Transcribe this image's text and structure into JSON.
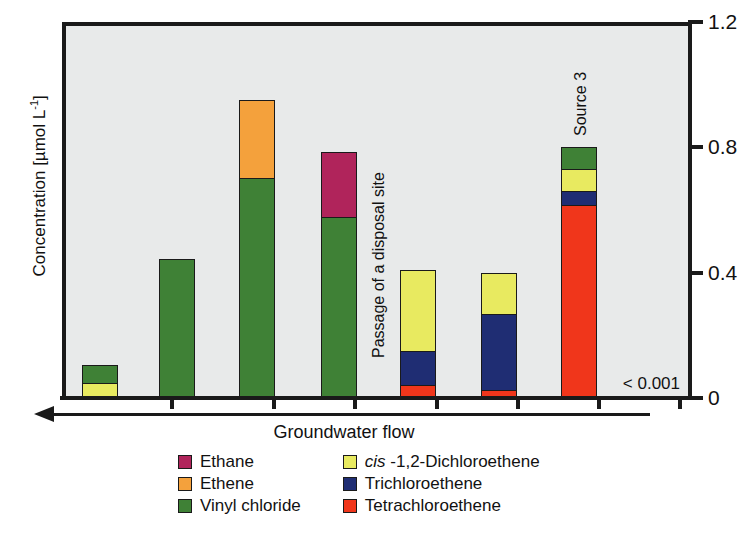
{
  "chart_data": {
    "type": "bar",
    "stacked": true,
    "title": "",
    "xlabel": "Groundwater flow",
    "ylabel": "Concentration [µmol L⁻¹]",
    "ylim": [
      0,
      1.2
    ],
    "yticks": [
      0,
      0.4,
      0.8,
      1.2
    ],
    "ytick_labels": [
      "0",
      "0.4",
      "0.8",
      "1.2"
    ],
    "grid": false,
    "legend_position": "below-plot",
    "categories": [
      "1",
      "2",
      "3",
      "4",
      "5",
      "6",
      "7"
    ],
    "series": [
      {
        "name": "Tetrachloroethene",
        "color": "#f0361b",
        "values": [
          0.0,
          0.0,
          0.0,
          0.0,
          0.035,
          0.02,
          0.615
        ]
      },
      {
        "name": "Trichloroethene",
        "color": "#1f2d73",
        "values": [
          0.0,
          0.0,
          0.0,
          0.0,
          0.11,
          0.245,
          0.045
        ]
      },
      {
        "name": "cis -1,2-Dichloroethene",
        "color": "#e8ea60",
        "values": [
          0.045,
          0.0,
          0.0,
          0.0,
          0.265,
          0.135,
          0.07
        ]
      },
      {
        "name": "Vinyl  chloride",
        "color": "#3f8136",
        "values": [
          0.06,
          0.445,
          0.7,
          0.575,
          0.0,
          0.0,
          0.07
        ]
      },
      {
        "name": "Ethene",
        "color": "#f4a13c",
        "values": [
          0.0,
          0.0,
          0.25,
          0.0,
          0.0,
          0.0,
          0.0
        ]
      },
      {
        "name": "Ethane",
        "color": "#b0245b",
        "values": [
          0.0,
          0.0,
          0.0,
          0.21,
          0.0,
          0.0,
          0.0
        ]
      }
    ],
    "annotations": [
      {
        "text": "Passage of a disposal site",
        "orientation": "vertical"
      },
      {
        "text": "Source 3",
        "orientation": "vertical"
      },
      {
        "text": "< 0.001",
        "orientation": "horizontal"
      }
    ]
  },
  "axis": {
    "y_title_main": "Concentration [µmol L",
    "y_title_sup": "-1",
    "y_title_tail": "]",
    "y_tick_labels": [
      "0",
      "0.4",
      "0.8",
      "1.2"
    ]
  },
  "annotations": {
    "disposal_site": "Passage of a disposal site",
    "source3": "Source 3",
    "detection_limit": "< 0.001",
    "flow_label": "Groundwater flow"
  },
  "legend": {
    "left_column": [
      {
        "label": "Ethane",
        "color": "#b0245b",
        "italic_prefix": ""
      },
      {
        "label": "Ethene",
        "color": "#f4a13c",
        "italic_prefix": ""
      },
      {
        "label": "Vinyl  chloride",
        "color": "#3f8136",
        "italic_prefix": ""
      }
    ],
    "right_column": [
      {
        "label": "-1,2-Dichloroethene",
        "color": "#e8ea60",
        "italic_prefix": "cis "
      },
      {
        "label": "Trichloroethene",
        "color": "#1f2d73",
        "italic_prefix": ""
      },
      {
        "label": "Tetrachloroethene",
        "color": "#f0361b",
        "italic_prefix": ""
      }
    ]
  },
  "colors": {
    "plot_background": "#e8eaea",
    "page_background": "#ffffff",
    "axis": "#1a1a1a"
  }
}
